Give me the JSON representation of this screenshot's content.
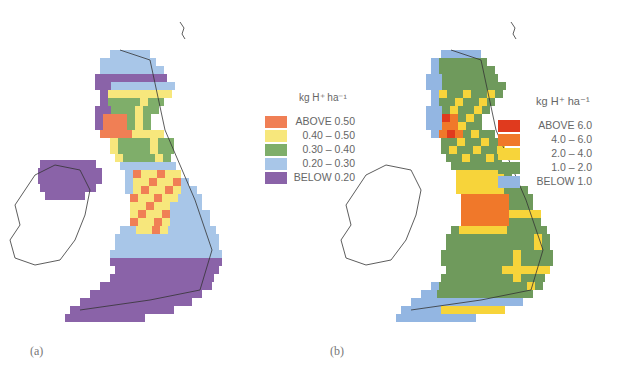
{
  "figure": {
    "panels": [
      {
        "id": "a",
        "caption": "(a)",
        "legend": {
          "unit": "kg H⁺ ha⁻¹",
          "items": [
            {
              "label": "ABOVE  0.50",
              "color": "#f07f55"
            },
            {
              "label": "0.40 – 0.50",
              "color": "#f7e77c"
            },
            {
              "label": "0.30 – 0.40",
              "color": "#7fae6a"
            },
            {
              "label": "0.20 – 0.30",
              "color": "#a8c6e8"
            },
            {
              "label": "BELOW  0.20",
              "color": "#8a63a8"
            }
          ]
        }
      },
      {
        "id": "b",
        "caption": "(b)",
        "legend": {
          "unit": "kg H⁺ ha⁻¹",
          "items": [
            {
              "label": "ABOVE  6.0",
              "color": "#e03a1e"
            },
            {
              "label": "4.0 – 6.0",
              "color": "#f0782a"
            },
            {
              "label": "2.0 – 4.0",
              "color": "#f7d43a"
            },
            {
              "label": "1.0 – 2.0",
              "color": "#6f9a5c"
            },
            {
              "label": "BELOW  1.0",
              "color": "#93b6e2"
            }
          ]
        }
      }
    ]
  },
  "chart_data": [
    {
      "type": "heatmap",
      "title": "(a) Acid deposition map of the British Isles",
      "legend_title": "kg H⁺ ha⁻¹",
      "classes": [
        "ABOVE 0.50",
        "0.40–0.50",
        "0.30–0.40",
        "0.20–0.30",
        "BELOW 0.20"
      ],
      "legend_position": "right"
    },
    {
      "type": "heatmap",
      "title": "(b) Acid deposition map of Great Britain",
      "legend_title": "kg H⁺ ha⁻¹",
      "classes": [
        "ABOVE 6.0",
        "4.0–6.0",
        "2.0–4.0",
        "1.0–2.0",
        "BELOW 1.0"
      ],
      "legend_position": "right"
    }
  ]
}
